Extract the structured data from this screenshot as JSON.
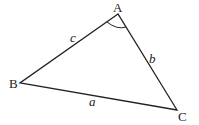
{
  "diagram": {
    "type": "triangle",
    "vertices": [
      {
        "name": "A",
        "x": 118,
        "y": 14
      },
      {
        "name": "B",
        "x": 20,
        "y": 83
      },
      {
        "name": "C",
        "x": 177,
        "y": 110
      }
    ],
    "vertex_labels": {
      "A": "A",
      "B": "B",
      "C": "C"
    },
    "side_labels": {
      "a": "a",
      "b": "b",
      "c": "c"
    },
    "angle_marker": "A",
    "colors": {
      "stroke": "#222222",
      "background": "#ffffff"
    }
  }
}
